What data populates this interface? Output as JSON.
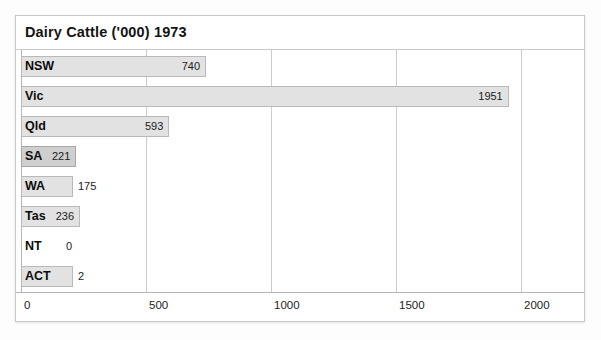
{
  "chart": {
    "title": "Dairy Cattle ('000) 1973"
  },
  "axis": {
    "ticks": [
      {
        "label": "0",
        "value": 0
      },
      {
        "label": "500",
        "value": 500
      },
      {
        "label": "1000",
        "value": 1000
      },
      {
        "label": "1500",
        "value": 1500
      },
      {
        "label": "2000",
        "value": 2000
      }
    ]
  },
  "rows": [
    {
      "category": "NSW",
      "value_label": "740",
      "value": 740
    },
    {
      "category": "Vic",
      "value_label": "1951",
      "value": 1951
    },
    {
      "category": "Qld",
      "value_label": "593",
      "value": 593
    },
    {
      "category": "SA",
      "value_label": "221",
      "value": 221
    },
    {
      "category": "WA",
      "value_label": "175",
      "value": 175
    },
    {
      "category": "Tas",
      "value_label": "236",
      "value": 236
    },
    {
      "category": "NT",
      "value_label": "0",
      "value": 0
    },
    {
      "category": "ACT",
      "value_label": "2",
      "value": 2
    }
  ],
  "colors": {
    "bar_fill": "#e2e2e2",
    "bar_fill_dark": "#cfcfcf",
    "bar_border": "#b9b9b9",
    "gridline": "#cccccc",
    "frame": "#c9c9c9",
    "text": "#141414",
    "page_background": "#fdfdfd",
    "plot_background": "#ffffff"
  },
  "chart_data": {
    "type": "bar",
    "orientation": "horizontal",
    "title": "Dairy Cattle ('000) 1973",
    "xlabel": "",
    "ylabel": "",
    "categories": [
      "NSW",
      "Vic",
      "Qld",
      "SA",
      "WA",
      "Tas",
      "NT",
      "ACT"
    ],
    "values": [
      740,
      1951,
      593,
      221,
      175,
      236,
      0,
      2
    ],
    "data_labels": [
      "740",
      "1951",
      "593",
      "221",
      "175",
      "236",
      "0",
      "2"
    ],
    "units": "'000 head",
    "xlim": [
      0,
      2100
    ],
    "xticks": [
      0,
      500,
      1000,
      1500,
      2000
    ],
    "xticklabels": [
      "0",
      "500",
      "1000",
      "1500",
      "2000"
    ],
    "grid": "vertical",
    "legend": "none",
    "series": [
      {
        "name": "Dairy Cattle ('000) 1973",
        "values": [
          740,
          1951,
          593,
          221,
          175,
          236,
          0,
          2
        ]
      }
    ]
  }
}
